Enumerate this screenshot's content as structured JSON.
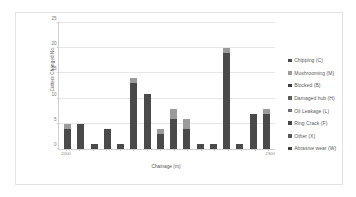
{
  "chart_data": {
    "type": "bar",
    "subtype": "stacked-column",
    "title": "",
    "xlabel": "Chainage (m)",
    "ylabel": "Cutters Changed No.",
    "ylim": [
      0,
      25
    ],
    "yticks": [
      0,
      5,
      10,
      15,
      20,
      25
    ],
    "ytick_labels": [
      "0",
      "5",
      "10",
      "15",
      "20",
      "25"
    ],
    "grid": true,
    "legend_position": "right",
    "xtick_labels": [
      "2000",
      "2300"
    ],
    "categories": [
      "2000",
      "2020",
      "2040",
      "2060",
      "2080",
      "2100",
      "2120",
      "2140",
      "2160",
      "2180",
      "2200",
      "2220",
      "2240",
      "2260",
      "2280",
      "2300"
    ],
    "totals": [
      5,
      5,
      1,
      4,
      1,
      14,
      11,
      4,
      8,
      6,
      1,
      1,
      20,
      1,
      7,
      8
    ],
    "series": [
      {
        "name": "Chipping (C)",
        "color": "#4a4a4a",
        "values": [
          4,
          5,
          1,
          4,
          1,
          13,
          11,
          3,
          6,
          4,
          1,
          1,
          19,
          1,
          7,
          7
        ]
      },
      {
        "name": "Mushrooming (M)",
        "color": "#9b9b9b",
        "values": [
          1,
          0,
          0,
          0,
          0,
          1,
          0,
          1,
          2,
          2,
          0,
          0,
          1,
          0,
          0,
          1
        ]
      },
      {
        "name": "Blocked (B)",
        "color": "#3d3d3d",
        "values": [
          0,
          0,
          0,
          0,
          0,
          0,
          0,
          0,
          0,
          0,
          0,
          0,
          0,
          0,
          0,
          0
        ]
      },
      {
        "name": "Damaged hub (H)",
        "color": "#5d5d5d",
        "values": [
          0,
          0,
          0,
          0,
          0,
          0,
          0,
          0,
          0,
          0,
          0,
          0,
          0,
          0,
          0,
          0
        ]
      },
      {
        "name": "Oil Leakage (L)",
        "color": "#6e6e6e",
        "values": [
          0,
          0,
          0,
          0,
          0,
          0,
          0,
          0,
          0,
          0,
          0,
          0,
          0,
          0,
          0,
          0
        ]
      },
      {
        "name": "Ring Crack (F)",
        "color": "#474747",
        "values": [
          0,
          0,
          0,
          0,
          0,
          0,
          0,
          0,
          0,
          0,
          0,
          0,
          0,
          0,
          0,
          0
        ]
      },
      {
        "name": "Other  (X)",
        "color": "#565656",
        "values": [
          0,
          0,
          0,
          0,
          0,
          0,
          0,
          0,
          0,
          0,
          0,
          0,
          0,
          0,
          0,
          0
        ]
      },
      {
        "name": "Abrasive wear (W)",
        "color": "#404040",
        "values": [
          0,
          0,
          0,
          0,
          0,
          0,
          0,
          0,
          0,
          0,
          0,
          0,
          0,
          0,
          0,
          0
        ]
      }
    ]
  },
  "axis": {
    "y_title": "Cutters Changed No.",
    "x_title": "Chainage (m)",
    "x_left_label": "2000",
    "x_right_label": "2300"
  },
  "legend": {
    "items": [
      {
        "label": "Chipping (C)"
      },
      {
        "label": "Mushrooming (M)"
      },
      {
        "label": "Blocked (B)"
      },
      {
        "label": "Damaged hub (H)"
      },
      {
        "label": "Oil Leakage (L)"
      },
      {
        "label": "Ring Crack (F)"
      },
      {
        "label": "Other  (X)"
      },
      {
        "label": "Abrasive wear (W)"
      }
    ]
  }
}
